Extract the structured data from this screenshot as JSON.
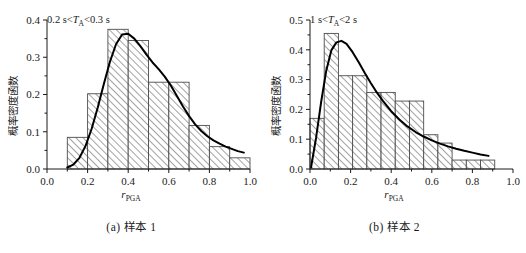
{
  "figure": {
    "panels": [
      {
        "id": "a",
        "caption": "(a) 样本 1",
        "annotation": {
          "prefix": "0.2 s<",
          "var": "T",
          "sub": "A",
          "suffix": "<0.3 s"
        },
        "ylabel": "概率密度函数",
        "xlabel": {
          "main": "r",
          "sub": "PGA"
        },
        "chart_data": {
          "type": "bar",
          "title": "",
          "subtitle": "0.2 s<TA<0.3 s",
          "xlabel": "r_PGA",
          "ylabel": "概率密度函数",
          "xlim": [
            0.0,
            1.0
          ],
          "ylim": [
            0.0,
            0.4
          ],
          "grid": false,
          "legend": "none",
          "xticks": [
            "0.0",
            "0.2",
            "0.4",
            "0.6",
            "0.8",
            "1.0"
          ],
          "xtick_values": [
            0.0,
            0.2,
            0.4,
            0.6,
            0.8,
            1.0
          ],
          "yticks": [
            "0.0",
            "0.1",
            "0.2",
            "0.3",
            "0.4"
          ],
          "ytick_values": [
            0.0,
            0.1,
            0.2,
            0.3,
            0.4
          ],
          "bin_edges": [
            0.1,
            0.2,
            0.3,
            0.4,
            0.5,
            0.6,
            0.7,
            0.8,
            0.9,
            1.0
          ],
          "values": [
            0.085,
            0.202,
            0.375,
            0.345,
            0.233,
            0.233,
            0.117,
            0.06,
            0.03
          ],
          "series": [
            {
              "name": "fitted probability density curve",
              "type": "line",
              "x": [
                0.1,
                0.13,
                0.16,
                0.19,
                0.22,
                0.25,
                0.28,
                0.31,
                0.34,
                0.37,
                0.4,
                0.43,
                0.46,
                0.49,
                0.52,
                0.55,
                0.58,
                0.61,
                0.64,
                0.67,
                0.7,
                0.73,
                0.76,
                0.79,
                0.82,
                0.85,
                0.88,
                0.91,
                0.94,
                0.97
              ],
              "y": [
                0.004,
                0.012,
                0.03,
                0.062,
                0.108,
                0.165,
                0.228,
                0.288,
                0.335,
                0.361,
                0.363,
                0.35,
                0.33,
                0.307,
                0.286,
                0.268,
                0.248,
                0.224,
                0.196,
                0.168,
                0.142,
                0.12,
                0.102,
                0.088,
                0.077,
                0.068,
                0.06,
                0.054,
                0.048,
                0.044
              ]
            }
          ]
        }
      },
      {
        "id": "b",
        "caption": "(b) 样本 2",
        "annotation": {
          "prefix": "1 s<",
          "var": "T",
          "sub": "A",
          "suffix": "<2 s"
        },
        "ylabel": "概率密度函数",
        "xlabel": {
          "main": "r",
          "sub": "PGA"
        },
        "chart_data": {
          "type": "bar",
          "title": "",
          "subtitle": "1 s<TA<2 s",
          "xlabel": "r_PGA",
          "ylabel": "概率密度函数",
          "xlim": [
            0.0,
            1.0
          ],
          "ylim": [
            0.0,
            0.5
          ],
          "grid": false,
          "legend": "none",
          "xticks": [
            "0.0",
            "0.2",
            "0.4",
            "0.6",
            "0.8",
            "1.0"
          ],
          "xtick_values": [
            0.0,
            0.2,
            0.4,
            0.6,
            0.8,
            1.0
          ],
          "yticks": [
            "0.0",
            "0.1",
            "0.2",
            "0.3",
            "0.4",
            "0.5"
          ],
          "ytick_values": [
            0.0,
            0.1,
            0.2,
            0.3,
            0.4,
            0.5
          ],
          "bin_edges": [
            0.0,
            0.07,
            0.14,
            0.21,
            0.28,
            0.35,
            0.42,
            0.49,
            0.56,
            0.63,
            0.7,
            0.77,
            0.84,
            0.91
          ],
          "values": [
            0.17,
            0.455,
            0.313,
            0.313,
            0.257,
            0.257,
            0.228,
            0.228,
            0.115,
            0.087,
            0.03,
            0.03,
            0.03
          ],
          "series": [
            {
              "name": "fitted probability density curve",
              "type": "line",
              "x": [
                0.005,
                0.03,
                0.055,
                0.08,
                0.105,
                0.13,
                0.155,
                0.18,
                0.21,
                0.24,
                0.27,
                0.3,
                0.33,
                0.36,
                0.4,
                0.44,
                0.48,
                0.52,
                0.56,
                0.6,
                0.64,
                0.68,
                0.72,
                0.76,
                0.8,
                0.84,
                0.88
              ],
              "y": [
                0.005,
                0.105,
                0.225,
                0.33,
                0.398,
                0.425,
                0.43,
                0.42,
                0.392,
                0.358,
                0.322,
                0.288,
                0.256,
                0.228,
                0.194,
                0.166,
                0.143,
                0.124,
                0.109,
                0.096,
                0.085,
                0.076,
                0.068,
                0.061,
                0.055,
                0.049,
                0.044
              ]
            }
          ]
        }
      }
    ]
  }
}
